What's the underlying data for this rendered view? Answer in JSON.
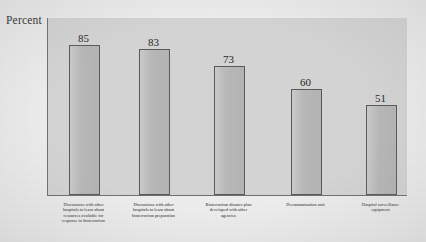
{
  "chart_data": {
    "type": "bar",
    "title": "",
    "xlabel": "",
    "ylabel": "Percent",
    "ylim": [
      0,
      101
    ],
    "grid": false,
    "legend": "none",
    "orientation": "vertical",
    "bar_color": "#bebebe",
    "bar_edge_color": "#585858",
    "plot_background": "#d5d5d5",
    "figure_background": "#eeeeee",
    "categories": [
      "Discussions with other hospitals to learn about resources available for response to bioterrorism",
      "Discussions with other hospitals to learn about bioterrorism preparation",
      "Bioterrorism disaster plan developed with other agencies",
      "Decontamination unit",
      "Hospital surveillance equipment"
    ],
    "category_lines": [
      [
        "Discussions with other",
        "hospitals to learn about",
        "resources available for",
        "response to bioterrorism"
      ],
      [
        "Discussions with other",
        "hospitals to learn about",
        "bioterrorism preparation"
      ],
      [
        "Bioterrorism disaster plan",
        "developed with other",
        "agencies"
      ],
      [
        "Decontamination unit"
      ],
      [
        "Hospital surveillance",
        "equipment"
      ]
    ],
    "values": [
      85,
      83,
      73,
      60,
      51
    ],
    "value_labels": [
      "85",
      "83",
      "73",
      "60",
      "51"
    ]
  }
}
